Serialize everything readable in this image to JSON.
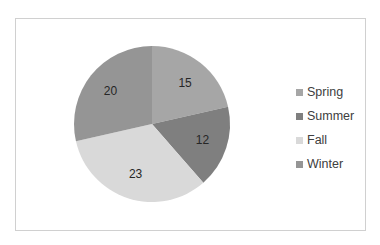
{
  "chart_data": {
    "type": "pie",
    "title": "",
    "categories": [
      "Spring",
      "Summer",
      "Fall",
      "Winter"
    ],
    "values": [
      15,
      12,
      23,
      20
    ],
    "colors": [
      "#a6a6a6",
      "#7f7f7f",
      "#d9d9d9",
      "#959595"
    ],
    "data_labels": [
      "15",
      "12",
      "23",
      "20"
    ],
    "legend_position": "right",
    "start_angle_deg": 0,
    "direction": "clockwise"
  },
  "legend": {
    "items": [
      {
        "label": "Spring",
        "color": "#a6a6a6"
      },
      {
        "label": "Summer",
        "color": "#7f7f7f"
      },
      {
        "label": "Fall",
        "color": "#d9d9d9"
      },
      {
        "label": "Winter",
        "color": "#959595"
      }
    ]
  }
}
